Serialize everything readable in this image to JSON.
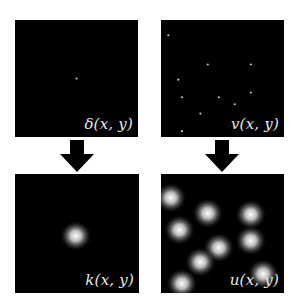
{
  "panels": {
    "delta": {
      "label": "δ(x, y)",
      "description": "single impulse point"
    },
    "v": {
      "label": "v(x, y)",
      "description": "sparse impulse points"
    },
    "k": {
      "label": "k(x, y)",
      "description": "blur kernel"
    },
    "u": {
      "label": "u(x, y)",
      "description": "convolved result"
    }
  },
  "points": {
    "delta": [
      [
        0.5,
        0.5
      ]
    ],
    "v": [
      [
        0.06,
        0.13
      ],
      [
        0.38,
        0.38
      ],
      [
        0.73,
        0.38
      ],
      [
        0.14,
        0.51
      ],
      [
        0.73,
        0.62
      ],
      [
        0.47,
        0.66
      ],
      [
        0.32,
        0.8
      ],
      [
        0.87,
        0.87
      ],
      [
        0.17,
        0.95
      ],
      [
        0.6,
        0.72
      ],
      [
        0.17,
        0.66
      ]
    ]
  },
  "blobs": {
    "k": [
      [
        0.49,
        0.52
      ]
    ],
    "u": [
      [
        0.08,
        0.2
      ],
      [
        0.38,
        0.33
      ],
      [
        0.73,
        0.34
      ],
      [
        0.15,
        0.47
      ],
      [
        0.73,
        0.56
      ],
      [
        0.47,
        0.62
      ],
      [
        0.32,
        0.74
      ],
      [
        0.83,
        0.84
      ],
      [
        0.17,
        0.92
      ]
    ]
  },
  "arrows": {
    "left": "down-arrow",
    "right": "down-arrow"
  },
  "colors": {
    "panel_bg": "#000000",
    "label": "#e8e8e8",
    "arrow": "#000000",
    "dot": "#bfbfbf"
  }
}
